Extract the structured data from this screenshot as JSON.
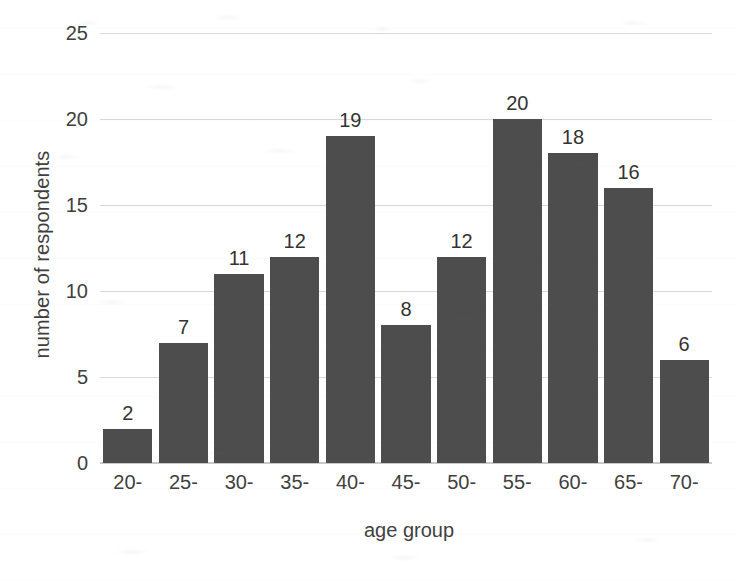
{
  "chart_data": {
    "type": "bar",
    "title": "",
    "subtitle": "",
    "xlabel": "age group",
    "ylabel": "number of respondents",
    "categories": [
      "20-",
      "25-",
      "30-",
      "35-",
      "40-",
      "45-",
      "50-",
      "55-",
      "60-",
      "65-",
      "70-"
    ],
    "values": [
      2,
      7,
      11,
      12,
      19,
      8,
      12,
      20,
      18,
      16,
      6
    ],
    "data_labels": [
      "2",
      "7",
      "11",
      "12",
      "19",
      "8",
      "12",
      "20",
      "18",
      "16",
      "6"
    ],
    "ylim": [
      0,
      25
    ],
    "xlim": null,
    "y_ticks": [
      0,
      5,
      10,
      15,
      20,
      25
    ],
    "y_tick_labels": [
      "0",
      "5",
      "10",
      "15",
      "20",
      "25"
    ],
    "grid": "horizontal",
    "legend": "none",
    "bar_color": "#4d4d4d",
    "gridline_color": "#d8d8d8",
    "text_color": "#3f3f3f",
    "background_color": "#ffffff",
    "annotations": []
  }
}
